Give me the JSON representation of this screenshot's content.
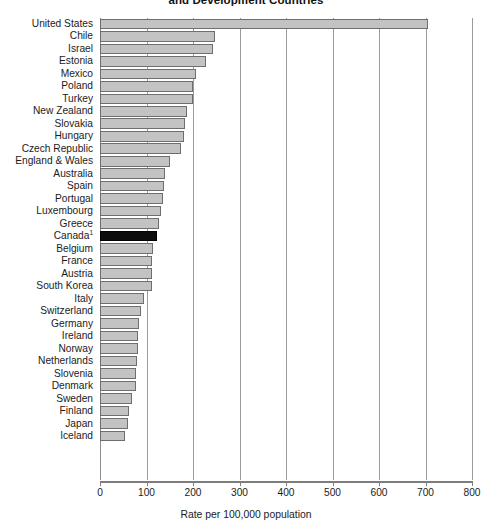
{
  "chart_data": {
    "type": "bar",
    "orientation": "horizontal",
    "title": "and Development Countries",
    "xlabel": "Rate per 100,000 population",
    "ylabel": "",
    "xlim": [
      0,
      800
    ],
    "xticks": [
      0,
      100,
      200,
      300,
      400,
      500,
      600,
      700,
      800
    ],
    "grid": true,
    "grid_axis": "x",
    "legend": "none",
    "highlight_category": "Canada",
    "highlight_color": "#0c0c0c",
    "bar_color": "#c3c3c3",
    "bar_border_color": "#6e6e6e",
    "footnote_marker": "1",
    "categories": [
      "United States",
      "Chile",
      "Israel",
      "Estonia",
      "Mexico",
      "Poland",
      "Turkey",
      "New Zealand",
      "Slovakia",
      "Hungary",
      "Czech Republic",
      "England & Wales",
      "Australia",
      "Spain",
      "Portugal",
      "Luxembourg",
      "Greece",
      "Canada",
      "Belgium",
      "France",
      "Austria",
      "South Korea",
      "Italy",
      "Switzerland",
      "Germany",
      "Ireland",
      "Norway",
      "Netherlands",
      "Slovenia",
      "Denmark",
      "Sweden",
      "Finland",
      "Japan",
      "Iceland"
    ],
    "values": [
      705,
      247,
      242,
      228,
      207,
      200,
      200,
      188,
      182,
      180,
      175,
      150,
      140,
      137,
      135,
      131,
      127,
      123,
      113,
      112,
      112,
      111,
      95,
      88,
      83,
      82,
      82,
      79,
      78,
      77,
      68,
      63,
      61,
      53
    ],
    "value_labels": []
  },
  "axis": {
    "tick_labels": [
      "0",
      "100",
      "200",
      "300",
      "400",
      "500",
      "600",
      "700",
      "800"
    ],
    "title": "Rate per 100,000 population"
  },
  "title": {
    "text": "and Development Countries"
  }
}
